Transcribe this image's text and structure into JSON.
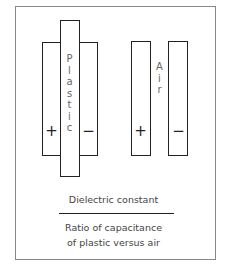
{
  "diagram": {
    "plastic_capacitor": {
      "dielectric_label": "Plastic",
      "positive_sign": "+",
      "negative_sign": "−"
    },
    "air_capacitor": {
      "dielectric_label": "Air",
      "positive_sign": "+",
      "negative_sign": "−"
    },
    "formula": {
      "numerator": "Dielectric constant",
      "denominator_line1": "Ratio of capacitance",
      "denominator_line2": "of plastic versus air"
    },
    "colors": {
      "stroke": "#222222",
      "label": "#666666",
      "frame": "#888888"
    }
  }
}
